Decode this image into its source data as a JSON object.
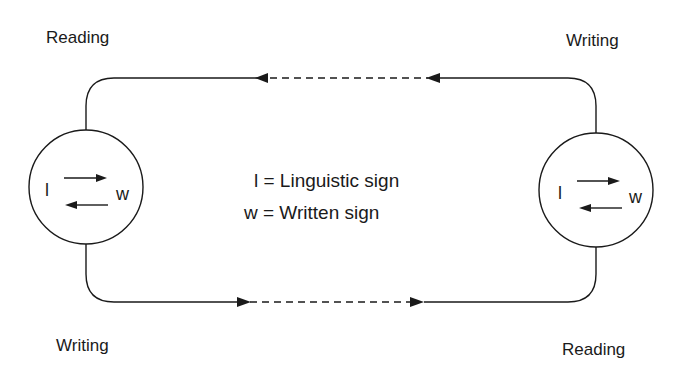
{
  "diagram": {
    "title": "",
    "corner_labels": {
      "top_left": "Reading",
      "top_right": "Writing",
      "bottom_left": "Writing",
      "bottom_right": "Reading"
    },
    "nodes": [
      {
        "id": "left",
        "symbol_l": "l",
        "symbol_w": "w"
      },
      {
        "id": "right",
        "symbol_l": "l",
        "symbol_w": "w"
      }
    ],
    "legend": [
      {
        "symbol": "l",
        "text": "l = Linguistic sign"
      },
      {
        "symbol": "w",
        "text": "w = Written sign"
      }
    ],
    "edges": [
      {
        "from": "right",
        "to": "left",
        "path": "top",
        "direction": "right-to-left",
        "style": "solid-dashed-solid"
      },
      {
        "from": "left",
        "to": "right",
        "path": "bottom",
        "direction": "left-to-right",
        "style": "solid-dashed-solid"
      }
    ],
    "colors": {
      "stroke": "#1a1a1a",
      "background": "#ffffff"
    }
  }
}
